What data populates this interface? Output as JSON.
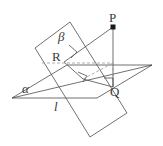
{
  "figure": {
    "stroke_color": "#4d4d4d",
    "dashed_color": "#9a9a9a",
    "point_color": "#1a1a1a",
    "background": "#ffffff",
    "labels": {
      "point_p": "P",
      "point_q": "Q",
      "point_r": "R",
      "plane_alpha": "α",
      "plane_beta": "β",
      "line_l": "l"
    },
    "points": {
      "P": {
        "x": 113,
        "y": 27
      },
      "Q": {
        "x": 113,
        "y": 87
      },
      "R": {
        "x": 64,
        "y": 62
      },
      "foot": {
        "x": 83,
        "y": 79
      },
      "l_intersection": {
        "x": 61,
        "y": 94
      }
    },
    "plane_alpha_vertices": "12,98 67,65 152,65 97,98",
    "plane_beta_vertices": "35,48 70,22 127,113 90,137",
    "line_l_endpoints": {
      "x1": 12,
      "y1": 98,
      "x2": 152,
      "y2": 65
    },
    "right_angle_markers": [
      {
        "name": "right-angle-at-q",
        "points": "104,78 113,78 113,87"
      },
      {
        "name": "right-angle-at-r",
        "points": "69,45 78,52 72,58"
      },
      {
        "name": "right-angle-at-foot",
        "points": "78,73 87,77 83,82"
      }
    ]
  }
}
